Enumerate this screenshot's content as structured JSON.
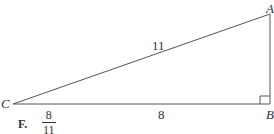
{
  "diagram": {
    "type": "right-triangle",
    "vertices": {
      "A": {
        "label": "A"
      },
      "B": {
        "label": "B",
        "right_angle": true
      },
      "C": {
        "label": "C"
      }
    },
    "sides": {
      "CA": {
        "label": "11",
        "role": "hypotenuse"
      },
      "CB": {
        "label": "8",
        "role": "adjacent-leg"
      },
      "AB": {
        "label": "",
        "role": "opposite-leg"
      }
    }
  },
  "answer_choice": {
    "letter": "F.",
    "numerator": "8",
    "denominator": "11"
  },
  "colors": {
    "line": "#555555",
    "text": "#333333"
  }
}
